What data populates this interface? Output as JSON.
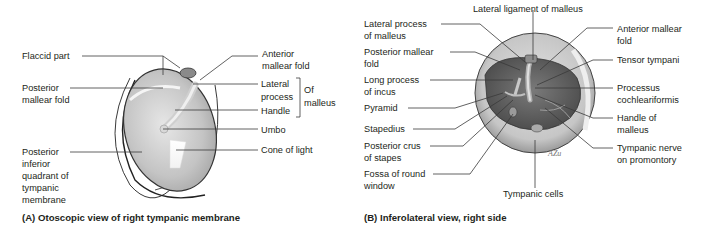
{
  "panel_a": {
    "caption": "(A) Otoscopic view of right tympanic membrane",
    "labels": {
      "flaccid_part": "Flaccid part",
      "posterior_mallear_fold": "Posterior\nmallear fold",
      "posterior_inferior_quadrant": "Posterior\ninferior\nquadrant of\ntympanic\nmembrane",
      "anterior_mallear_fold": "Anterior\nmallear fold",
      "lateral_process": "Lateral\nprocess",
      "handle": "Handle",
      "of_malleus": "Of\nmalleus",
      "umbo": "Umbo",
      "cone_of_light": "Cone of light"
    }
  },
  "panel_b": {
    "caption": "(B) Inferolateral view, right side",
    "labels": {
      "lateral_ligament_of_malleus": "Lateral ligament of malleus",
      "lateral_process_of_malleus": "Lateral process\nof malleus",
      "posterior_mallear_fold": "Posterior mallear\nfold",
      "long_process_of_incus": "Long process\nof incus",
      "pyramid": "Pyramid",
      "stapedius": "Stapedius",
      "posterior_crus_of_stapes": "Posterior crus\nof stapes",
      "fossa_of_round_window": "Fossa of round\nwindow",
      "anterior_mallear_fold": "Anterior mallear\nfold",
      "tensor_tympani": "Tensor tympani",
      "processus_cochleariformis": "Processus\ncochleariformis",
      "handle_of_malleus": "Handle of\nmalleus",
      "tympanic_nerve_on_promontory": "Tympanic nerve\non promontory",
      "tympanic_cells": "Tympanic cells",
      "signature": "AZu"
    }
  },
  "colors": {
    "leader_line": "#3a3a3a",
    "membrane_light": "#dcdcdc",
    "membrane_mid": "#b8b8b8",
    "cavity_dark": "#5a5a5a"
  }
}
